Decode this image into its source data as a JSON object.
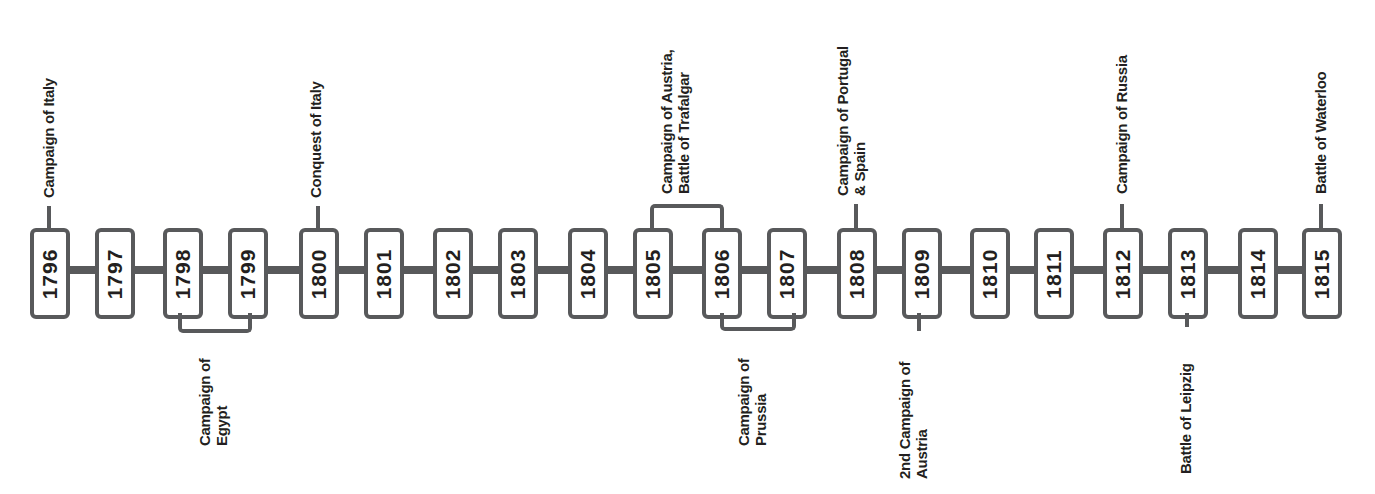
{
  "colors": {
    "line": "#58595b",
    "text": "#231f20",
    "background": "#ffffff"
  },
  "years": [
    {
      "label": "1796",
      "x": 30
    },
    {
      "label": "1797",
      "x": 95
    },
    {
      "label": "1798",
      "x": 163
    },
    {
      "label": "1799",
      "x": 228
    },
    {
      "label": "1800",
      "x": 299
    },
    {
      "label": "1801",
      "x": 364
    },
    {
      "label": "1802",
      "x": 433
    },
    {
      "label": "1803",
      "x": 498
    },
    {
      "label": "1804",
      "x": 568
    },
    {
      "label": "1805",
      "x": 633
    },
    {
      "label": "1806",
      "x": 702
    },
    {
      "label": "1807",
      "x": 767
    },
    {
      "label": "1808",
      "x": 837
    },
    {
      "label": "1809",
      "x": 902
    },
    {
      "label": "1810",
      "x": 970
    },
    {
      "label": "1811",
      "x": 1034
    },
    {
      "label": "1812",
      "x": 1103
    },
    {
      "label": "1813",
      "x": 1168
    },
    {
      "label": "1814",
      "x": 1238
    },
    {
      "label": "1815",
      "x": 1302
    }
  ],
  "events": [
    {
      "id": "campaign-italy",
      "label": "Campaign of Italy",
      "years": [
        "1796"
      ],
      "side": "top"
    },
    {
      "id": "conquest-italy",
      "label": "Conquest of Italy",
      "years": [
        "1800"
      ],
      "side": "top"
    },
    {
      "id": "campaign-austria-trafalgar",
      "label": "Campaign of Austria,\nBattle of Trafalgar",
      "years": [
        "1805",
        "1806"
      ],
      "side": "top"
    },
    {
      "id": "campaign-portugal-spain",
      "label": "Campaign of Portugal\n& Spain",
      "years": [
        "1808"
      ],
      "side": "top"
    },
    {
      "id": "campaign-russia",
      "label": "Campaign of Russia",
      "years": [
        "1812"
      ],
      "side": "top"
    },
    {
      "id": "battle-waterloo",
      "label": "Battle of Waterloo",
      "years": [
        "1815"
      ],
      "side": "top"
    },
    {
      "id": "campaign-egypt",
      "label": "Campaign of\nEgypt",
      "years": [
        "1798",
        "1799"
      ],
      "side": "bottom"
    },
    {
      "id": "campaign-prussia",
      "label": "Campaign of\nPrussia",
      "years": [
        "1806",
        "1807"
      ],
      "side": "bottom"
    },
    {
      "id": "second-campaign-austria",
      "label": "2nd Campaign of\nAustria",
      "years": [
        "1809"
      ],
      "side": "bottom"
    },
    {
      "id": "battle-leipzig",
      "label": "Battle of Leipzig",
      "years": [
        "1813"
      ],
      "side": "bottom"
    }
  ]
}
